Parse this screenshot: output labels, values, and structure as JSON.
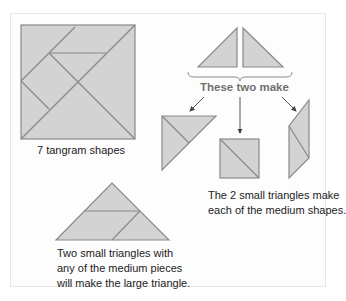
{
  "figure": {
    "square_caption": "7 tangram shapes",
    "small_triangles_label": "These two make",
    "medium_caption": {
      "line1": "The 2 small triangles make",
      "line2": "each of the medium shapes."
    },
    "large_caption": {
      "line1": "Two small triangles with",
      "line2": "any of the medium pieces",
      "line3": "will make the large triangle."
    }
  },
  "colors": {
    "shape_fill": "#d3d3d3",
    "shape_stroke": "#8a8a8a",
    "arrow": "#444444",
    "label_gray": "#707070"
  }
}
